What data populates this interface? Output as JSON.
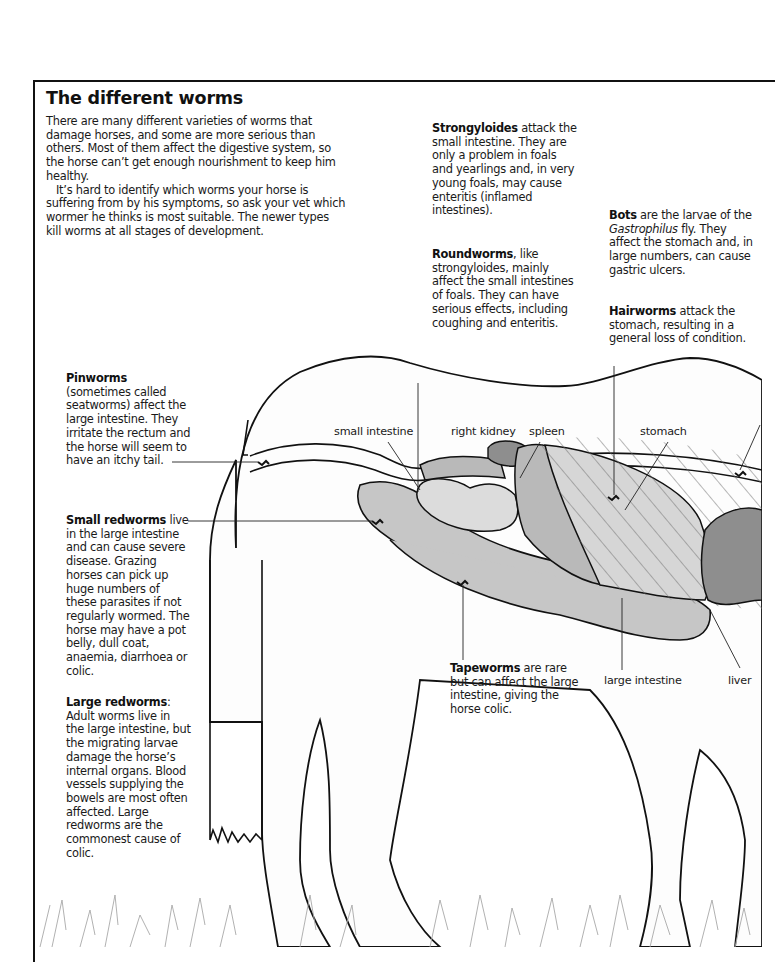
{
  "page": {
    "title": "The different worms",
    "intro": [
      "There are many different varieties of worms that damage horses, and some are more serious than others. Most of them affect the digestive system, so the horse can’t get enough nourishment to keep him healthy.",
      "It’s hard to identify which worms your horse is suffering from by his symptoms, so ask your vet which wormer he thinks is most suitable. The newer types kill worms at all stages of development."
    ]
  },
  "worms": {
    "strongyloides": {
      "name": "Strongyloides",
      "text": " attack the small intestine. They are only a problem in foals and yearlings and, in very young foals, may cause enteritis (inflamed intestines)."
    },
    "roundworms": {
      "name": "Roundworms",
      "text": ", like strongyloides, mainly affect the small intestines of foals. They can have serious effects, including coughing and enteritis."
    },
    "bots": {
      "name": "Bots",
      "text_before": " are the larvae of the ",
      "italic": "Gastrophilus",
      "text_after": " fly. They affect the stomach and, in large numbers, can cause gastric ulcers."
    },
    "hairworms": {
      "name": "Hairworms",
      "text": " attack the stomach, resulting in a general loss of condition."
    },
    "pinworms": {
      "name": "Pinworms",
      "text": " (sometimes called seatworms) affect the large intestine. They irritate the rectum and the horse will seem to have an itchy tail."
    },
    "small_redworms": {
      "name": "Small redworms",
      "text": " live in the large intestine and can cause severe disease. Grazing horses can pick up huge numbers of these parasites if not regularly wormed. The horse may have a pot belly, dull coat, anaemia, diarrhoea or colic."
    },
    "large_redworms": {
      "name": "Large redworms",
      "text": ": Adult worms live in the large intestine, but the migrating larvae damage the horse’s internal organs. Blood vessels supplying the bowels are most often affected. Large redworms are the commonest cause of colic."
    },
    "tapeworms": {
      "name": "Tapeworms",
      "text": " are rare but can affect the large intestine, giving the horse colic."
    }
  },
  "organ_labels": {
    "small_intestine": "small intestine",
    "right_kidney": "right kidney",
    "spleen": "spleen",
    "stomach": "stomach",
    "large_intestine": "large intestine",
    "liver": "liver"
  },
  "colors": {
    "outline": "#111111",
    "organ_light": "#d3d3d3",
    "organ_mid": "#b9b9b9",
    "organ_dark": "#8e8e8e",
    "hatch": "#6f6f6f",
    "grass": "#a8a8a8"
  }
}
